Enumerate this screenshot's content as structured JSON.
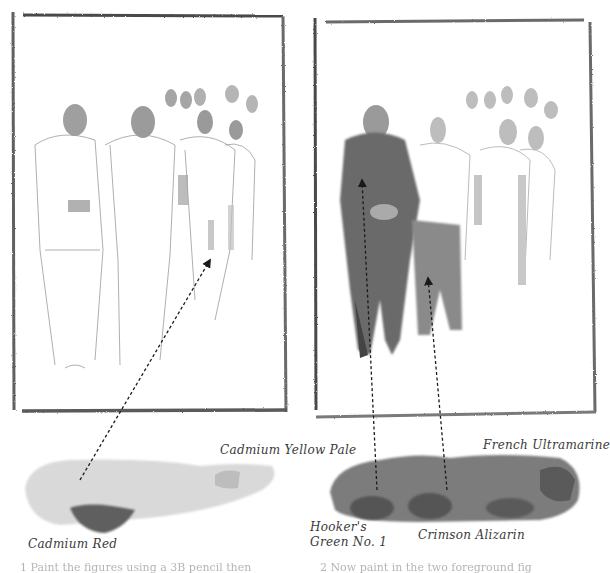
{
  "illustration": {
    "panels": [
      {
        "name": "left-sketch",
        "description": "pencil sketch of group of figures with light wash"
      },
      {
        "name": "right-sketch",
        "description": "sketch with dark wash on two foreground figures"
      }
    ],
    "swatches": [
      {
        "name": "left-swatch",
        "colors": [
          "Cadmium Yellow Pale",
          "Cadmium Red"
        ]
      },
      {
        "name": "right-swatch",
        "colors": [
          "French Ultramarine",
          "Hooker's Green No. 1",
          "Crimson Alizarin"
        ]
      }
    ]
  },
  "labels": {
    "cadmium_yellow_pale": "Cadmium Yellow Pale",
    "cadmium_red": "Cadmium Red",
    "french_ultramarine": "French Ultramarine",
    "hookers_green_line1": "Hooker's",
    "hookers_green_line2": "Green No. 1",
    "crimson_alizarin": "Crimson Alizarin"
  },
  "captions": {
    "left": "1  Paint the figures using a 3B pencil then",
    "right": "2  Now paint in the two foreground fig"
  },
  "colors": {
    "frame": "#5a5a5a",
    "wash_light": "#d8d8d8",
    "wash_mid": "#8a8a8a",
    "wash_dark": "#5e5e5e",
    "text": "#3a3a3a"
  }
}
